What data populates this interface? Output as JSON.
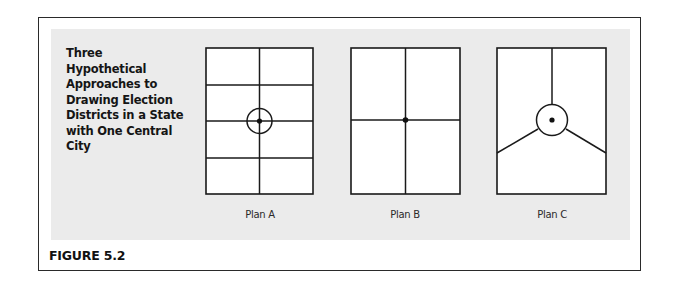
{
  "figure": {
    "label": "FIGURE 5.2",
    "title": "Three Hypothetical Approaches to Drawing Election Districts in a State with One Central City",
    "title_lines": [
      "Three Hypothetical",
      "Approaches to",
      "Drawing Election",
      "Districts in a State",
      "with One Central",
      "City"
    ]
  },
  "plans": [
    {
      "caption": "Plan A",
      "layout": "2 columns x 4 rows grid",
      "districts": 8,
      "city_marker": "circle with dot at center"
    },
    {
      "caption": "Plan B",
      "layout": "2 columns x 2 rows grid",
      "districts": 4,
      "city_marker": "dot at center"
    },
    {
      "caption": "Plan C",
      "layout": "3 wedges radiating from central circle plus city district",
      "districts": 4,
      "city_marker": "circle with dot at center"
    }
  ],
  "colors": {
    "panel_bg": "#ebebeb",
    "line": "#1a1a1a",
    "frame": "#2a2a2a"
  }
}
